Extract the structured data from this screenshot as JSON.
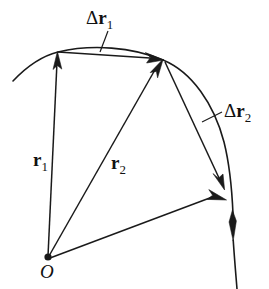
{
  "figure": {
    "kind": "vector-displacement-diagram",
    "width": 269,
    "height": 289,
    "background_color": "#ffffff",
    "stroke_color": "#1a1a1a",
    "text_color": "#111111"
  },
  "labels": {
    "delta_r1": "Δr₁",
    "delta_r1_parts": {
      "delta": "Δ",
      "symbol": "r",
      "subscript": "1"
    },
    "delta_r2": "Δr₂",
    "delta_r2_parts": {
      "delta": "Δ",
      "symbol": "r",
      "subscript": "2"
    },
    "r1": "r₁",
    "r1_parts": {
      "symbol": "r",
      "subscript": "1"
    },
    "r2": "r₂",
    "r2_parts": {
      "symbol": "r",
      "subscript": "2"
    },
    "origin": "O"
  },
  "geometry": {
    "origin_point": {
      "x": 48,
      "y": 258
    },
    "point_p1": {
      "x": 57,
      "y": 53
    },
    "point_p2": {
      "x": 163,
      "y": 60
    },
    "point_p3": {
      "x": 226,
      "y": 199
    },
    "trajectory_start": {
      "x": 13,
      "y": 81
    },
    "trajectory_end": {
      "x": 237,
      "y": 289
    },
    "vectors": [
      {
        "name": "r1",
        "from": "origin",
        "to": "point_p1",
        "arrow": "end"
      },
      {
        "name": "r2",
        "from": "origin",
        "to": "point_p2",
        "arrow": "end"
      },
      {
        "name": "r3",
        "from": "origin",
        "to": "point_p3",
        "arrow": "end"
      },
      {
        "name": "delta_r1",
        "from": "point_p1",
        "to": "point_p2",
        "arrow": "end"
      },
      {
        "name": "delta_r2",
        "from": "point_p2",
        "to": "point_p3",
        "arrow": "end"
      }
    ]
  }
}
